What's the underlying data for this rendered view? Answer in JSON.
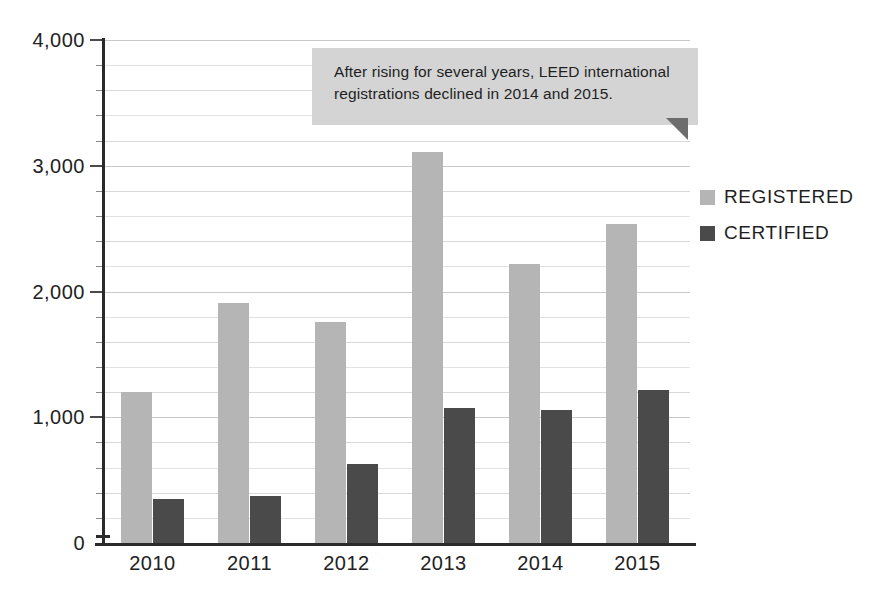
{
  "chart_data": {
    "type": "bar",
    "title": "",
    "subtitle": "",
    "xlabel": "",
    "ylabel": "",
    "categories": [
      "2010",
      "2011",
      "2012",
      "2013",
      "2014",
      "2015"
    ],
    "series": [
      {
        "name": "REGISTERED",
        "color": "#b5b5b5",
        "values": [
          1200,
          1910,
          1760,
          3110,
          2215,
          2540
        ]
      },
      {
        "name": "CERTIFIED",
        "color": "#4a4a4a",
        "values": [
          350,
          375,
          630,
          1070,
          1055,
          1215
        ]
      }
    ],
    "ylim": [
      0,
      4000
    ],
    "y_major_ticks": [
      0,
      1000,
      2000,
      3000,
      4000
    ],
    "y_major_tick_labels": [
      "0",
      "1,000",
      "2,000",
      "3,000",
      "4,000"
    ],
    "y_minor_tick_step": 200,
    "grid": true,
    "grid_axis": "y",
    "legend_position": "right",
    "annotations": [
      {
        "name": "callout",
        "text": "After rising for several years, LEED international registrations declined in 2014 and 2015.",
        "line1": "After rising for several years, LEED international",
        "line2": "registrations declined in 2014 and 2015.",
        "background": "#d4d4d4",
        "fold_color": "#6d6d6d"
      }
    ],
    "colors": {
      "registered": "#b5b5b5",
      "certified": "#4a4a4a",
      "axis": "#2a2a2a",
      "gridline": "#c9c9c9",
      "background": "#ffffff",
      "text": "#1f1f1f"
    }
  },
  "legend": {
    "items": [
      {
        "label": "REGISTERED",
        "color": "#b5b5b5"
      },
      {
        "label": "CERTIFIED",
        "color": "#4a4a4a"
      }
    ]
  },
  "axes": {
    "y_labels": [
      "4,000",
      "3,000",
      "2,000",
      "1,000",
      "0"
    ],
    "x_labels": [
      "2010",
      "2011",
      "2012",
      "2013",
      "2014",
      "2015"
    ]
  },
  "callout": {
    "line1": "After rising for several years, LEED international",
    "line2": "registrations declined in 2014 and 2015."
  }
}
